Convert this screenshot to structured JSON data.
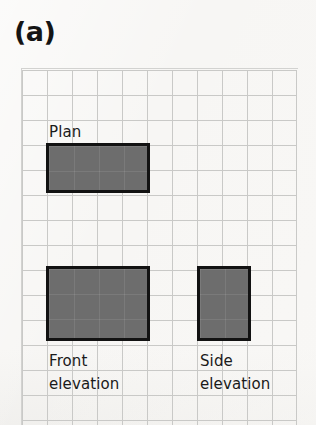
{
  "figure": {
    "panel_label": "(a)",
    "background_color": "#f7f6f4",
    "grid": {
      "cell_size_px": 25,
      "columns": 11,
      "rows": 14,
      "line_color": "#c9c9c7",
      "origin_x_px": 22,
      "origin_y_px": 70
    },
    "shape_style": {
      "fill_color": "#6d6d6d",
      "stroke_color": "#121212",
      "stroke_width_px": 3
    },
    "views": [
      {
        "id": "plan",
        "label": "Plan",
        "label_position": "above",
        "label_lines": [
          "Plan"
        ],
        "width_cells": 4,
        "height_cells": 2,
        "x_px": 46,
        "y_px": 143,
        "width_px": 104,
        "height_px": 50
      },
      {
        "id": "front-elevation",
        "label": "Front elevation",
        "label_position": "below",
        "label_lines": [
          "Front",
          "elevation"
        ],
        "width_cells": 4,
        "height_cells": 3,
        "x_px": 46,
        "y_px": 266,
        "width_px": 104,
        "height_px": 75
      },
      {
        "id": "side-elevation",
        "label": "Side elevation",
        "label_position": "below",
        "label_lines": [
          "Side",
          "elevation"
        ],
        "width_cells": 2,
        "height_cells": 3,
        "x_px": 197,
        "y_px": 266,
        "width_px": 54,
        "height_px": 75
      }
    ]
  }
}
